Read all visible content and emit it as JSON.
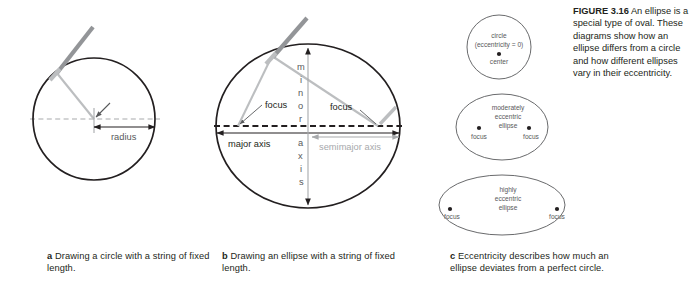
{
  "figure": {
    "label": "FIGURE 3.16",
    "text": " An ellipse is a special type of oval. These diagrams show how an ellipse differs from a circle and how different ellipses vary in their eccentricity."
  },
  "panel_a": {
    "letter": "a",
    "caption": "  Drawing a circle with a string of fixed length.",
    "radius_label": "radius",
    "shape": "circle",
    "center_x": 94,
    "center_y": 119,
    "radius": 61
  },
  "panel_b": {
    "letter": "b",
    "caption": "  Drawing an ellipse with a string of fixed length.",
    "focus_left_label": "focus",
    "focus_right_label": "focus",
    "major_axis_label": "major axis",
    "semimajor_axis_label": "semimajor axis",
    "minor_axis_label": "minor axis",
    "minor_axis_letters": [
      "m",
      "i",
      "n",
      "o",
      "r",
      "a",
      "x",
      "i",
      "s"
    ],
    "shape": "ellipse",
    "center_x": 308,
    "center_y": 126,
    "rx": 92,
    "ry": 88,
    "focus_left_x": 238,
    "focus_right_x": 378
  },
  "panel_c": {
    "letter": "c",
    "caption": "  Eccentricity describes how much an ellipse deviates from a perfect circle.",
    "shapes": [
      {
        "name": "circle",
        "title_lines": [
          "circle",
          "(eccentricity = 0)"
        ],
        "point_labels": [
          "center"
        ],
        "center_x": 499,
        "center_y": 47,
        "rx": 32,
        "ry": 32
      },
      {
        "name": "moderately-eccentric-ellipse",
        "title_lines": [
          "moderately",
          "eccentric",
          "ellipse"
        ],
        "point_labels": [
          "focus",
          "focus"
        ],
        "center_x": 502,
        "center_y": 127,
        "rx": 46,
        "ry": 33
      },
      {
        "name": "highly-eccentric-ellipse",
        "title_lines": [
          "highly",
          "eccentric",
          "ellipse"
        ],
        "point_labels": [
          "focus",
          "focus"
        ],
        "center_x": 502,
        "center_y": 205,
        "rx": 63,
        "ry": 30
      }
    ]
  },
  "colors": {
    "background": "#ffffff",
    "outline": "#231f20",
    "string": "#bcbec0",
    "pencil": "#939598",
    "axis_gray": "#a7a9ac",
    "text": "#231f20",
    "text_gray": "#58595b"
  }
}
